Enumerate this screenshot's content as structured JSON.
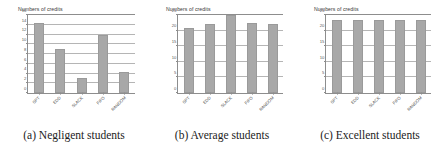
{
  "figure": {
    "panels": [
      {
        "caption": "(a) Negligent students",
        "chart_title": "Numbers of credits"
      },
      {
        "caption": "(b) Average students",
        "chart_title": "Numbers of credits"
      },
      {
        "caption": "(c) Excellent students",
        "chart_title": "Numbers of credits"
      }
    ]
  },
  "chart_data": [
    {
      "type": "bar",
      "title": "Numbers of credits",
      "subtitle": "(a) Negligent students",
      "categories": [
        "SPT",
        "EDD",
        "SLACK",
        "FIFO",
        "RANDOM"
      ],
      "values": [
        14.3,
        9.0,
        3.0,
        12.0,
        4.3
      ],
      "xlabel": "",
      "ylabel": "Numbers of credits",
      "ylim": [
        0,
        16
      ],
      "yticks": [
        0,
        2,
        4,
        6,
        8,
        10,
        12,
        14,
        16
      ],
      "ytick_labels": [
        "0",
        "2",
        "4",
        "6",
        "8",
        "10",
        "12",
        "14",
        "16"
      ],
      "grid": true,
      "legend": false,
      "bar_color": "#a8a8a8"
    },
    {
      "type": "bar",
      "title": "Numbers of credits",
      "subtitle": "(b) Average students",
      "categories": [
        "SPT",
        "EDD",
        "SLACK",
        "FIFO",
        "RANDOM"
      ],
      "values": [
        20.8,
        22.0,
        25.0,
        22.5,
        22.2
      ],
      "xlabel": "",
      "ylabel": "Numbers of credits",
      "ylim": [
        0,
        25
      ],
      "yticks": [
        0,
        5,
        10,
        15,
        20,
        25
      ],
      "ytick_labels": [
        "0",
        "5",
        "10",
        "15",
        "20",
        "25"
      ],
      "grid": true,
      "legend": false,
      "bar_color": "#a8a8a8"
    },
    {
      "type": "bar",
      "title": "Numbers of credits",
      "subtitle": "(c) Excellent students",
      "categories": [
        "SPT",
        "EDD",
        "SLACK",
        "FIFO",
        "RANDOM"
      ],
      "values": [
        23.3,
        23.3,
        23.3,
        23.3,
        23.3
      ],
      "xlabel": "",
      "ylabel": "Numbers of credits",
      "ylim": [
        0,
        25
      ],
      "yticks": [
        0,
        5,
        10,
        15,
        20,
        25
      ],
      "ytick_labels": [
        "0",
        "5",
        "10",
        "15",
        "20",
        "25"
      ],
      "grid": true,
      "legend": false,
      "bar_color": "#a8a8a8"
    }
  ]
}
